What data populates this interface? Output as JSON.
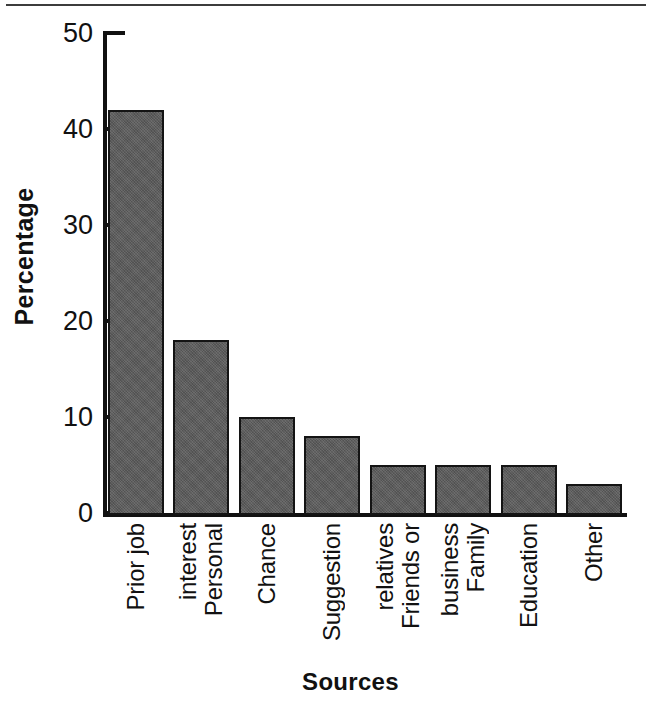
{
  "chart_data": {
    "type": "bar",
    "title": "",
    "xlabel": "Sources",
    "ylabel": "Percentage",
    "categories": [
      "Prior job",
      "Personal interest",
      "Chance",
      "Suggestion",
      "Friends or relatives",
      "Family business",
      "Education",
      "Other"
    ],
    "category_lines": [
      [
        "Prior job"
      ],
      [
        "Personal",
        "interest"
      ],
      [
        "Chance"
      ],
      [
        "Suggestion"
      ],
      [
        "Friends or",
        "relatives"
      ],
      [
        "Family",
        "business"
      ],
      [
        "Education"
      ],
      [
        "Other"
      ]
    ],
    "values": [
      42,
      18,
      10,
      8,
      5,
      5,
      5,
      3
    ],
    "ylim": [
      0,
      50
    ],
    "yticks": [
      0,
      10,
      20,
      30,
      40,
      50
    ],
    "ytick_labels": [
      "0",
      "10",
      "20",
      "30",
      "40",
      "50"
    ],
    "grid": false,
    "legend": false,
    "bar_color": "#595959",
    "bar_edge_color": "#141414",
    "axis_color": "#111111",
    "background": "#ffffff"
  }
}
